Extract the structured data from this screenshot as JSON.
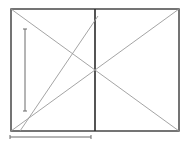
{
  "diagram": {
    "type": "geometric-construction",
    "canvas": {
      "width": 186,
      "height": 147,
      "background": "#ffffff"
    },
    "colors": {
      "frame": "#3a3a3a",
      "divider": "#2a2a2a",
      "diagonal": "#9a9a9a",
      "scale_bar": "#6a6a6a"
    },
    "frame": {
      "x1": 11,
      "y1": 9,
      "x2": 179,
      "y2": 131
    },
    "divider": {
      "x": 95,
      "y1": 9,
      "y2": 131
    },
    "diagonals": [
      {
        "name": "diagonal-tl-br",
        "x1": 11,
        "y1": 9,
        "x2": 179,
        "y2": 131
      },
      {
        "name": "diagonal-bl-tr",
        "x1": 11,
        "y1": 131,
        "x2": 179,
        "y2": 9
      },
      {
        "name": "diagonal-steep",
        "x1": 20,
        "y1": 131,
        "x2": 98,
        "y2": 16
      }
    ],
    "scale_bars": [
      {
        "name": "vertical-scale-bar",
        "x1": 25,
        "y1": 29,
        "x2": 25,
        "y2": 111,
        "tick": 2
      },
      {
        "name": "horizontal-scale-bar",
        "x1": 10,
        "y1": 137,
        "x2": 91,
        "y2": 137,
        "tick": 2
      }
    ]
  }
}
